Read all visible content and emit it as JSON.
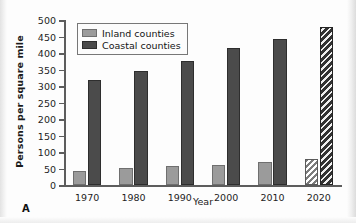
{
  "panel_label": "A",
  "axis": {
    "y_title": "Persons per square mile",
    "x_title": "Year",
    "y_ticks": [
      "500",
      "450",
      "400",
      "350",
      "300",
      "250",
      "200",
      "150",
      "100",
      "50",
      "0"
    ]
  },
  "legend": {
    "items": [
      {
        "label": "Inland counties",
        "color": "#9b9b9b",
        "key": "inland"
      },
      {
        "label": "Coastal counties",
        "color": "#4b4b4b",
        "key": "coastal"
      }
    ]
  },
  "chart_data": {
    "type": "bar",
    "title": "",
    "xlabel": "Year",
    "ylabel": "Persons per square mile",
    "ylim": [
      0,
      500
    ],
    "ytick_step": 50,
    "grid": false,
    "legend_position": "top-left inside",
    "categories": [
      "1970",
      "1980",
      "1990",
      "2000",
      "2010",
      "2020"
    ],
    "projected_categories": [
      "2020"
    ],
    "series": [
      {
        "name": "Inland counties",
        "color": "#9b9b9b",
        "values": [
          45,
          52,
          58,
          63,
          70,
          80
        ],
        "hatched": [
          false,
          false,
          false,
          false,
          false,
          true
        ]
      },
      {
        "name": "Coastal counties",
        "color": "#4b4b4b",
        "values": [
          320,
          348,
          378,
          415,
          445,
          480
        ],
        "hatched": [
          false,
          false,
          false,
          false,
          false,
          true
        ]
      }
    ]
  }
}
